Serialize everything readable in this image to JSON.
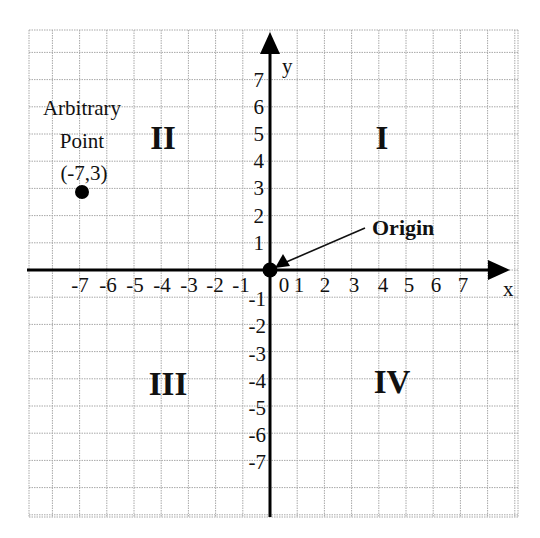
{
  "chart_data": {
    "type": "scatter",
    "title": "",
    "xlabel": "x",
    "ylabel": "y",
    "xlim": [
      -9,
      9
    ],
    "ylim": [
      -9,
      9
    ],
    "grid": true,
    "x_ticks": [
      -7,
      -6,
      -5,
      -4,
      -3,
      -2,
      -1,
      0,
      1,
      2,
      3,
      4,
      5,
      6,
      7
    ],
    "x_tick_labels": [
      "-7",
      "-6",
      "-5",
      "-4",
      "-3",
      "-2",
      "-1",
      "0",
      "1",
      "2",
      "3",
      "4",
      "5",
      "6",
      "7"
    ],
    "y_ticks": [
      7,
      6,
      5,
      4,
      3,
      2,
      1,
      -1,
      -2,
      -3,
      -4,
      -5,
      -6,
      -7
    ],
    "y_tick_labels": [
      "7",
      "6",
      "5",
      "4",
      "3",
      "2",
      "1",
      "-1",
      "-2",
      "-3",
      "-4",
      "-5",
      "-6",
      "-7"
    ],
    "points": [
      {
        "name": "Arbitrary Point",
        "x": -7,
        "y": 3,
        "label": "(-7,3)"
      },
      {
        "name": "Origin",
        "x": 0,
        "y": 0,
        "label": "Origin"
      }
    ],
    "quadrants": [
      {
        "id": "I",
        "label": "I"
      },
      {
        "id": "II",
        "label": "II"
      },
      {
        "id": "III",
        "label": "III"
      },
      {
        "id": "IV",
        "label": "IV"
      }
    ]
  },
  "labels": {
    "x_axis": "x",
    "y_axis": "y",
    "quadrant_1": "I",
    "quadrant_2": "II",
    "quadrant_3": "III",
    "quadrant_4": "IV",
    "arbitrary_line1": "Arbitrary",
    "arbitrary_line2": "Point",
    "arbitrary_coords": "(-7,3)",
    "origin": "Origin"
  },
  "colors": {
    "grid": "#a8a8a8",
    "axis": "#000000",
    "text": "#111111",
    "background": "#ffffff"
  }
}
